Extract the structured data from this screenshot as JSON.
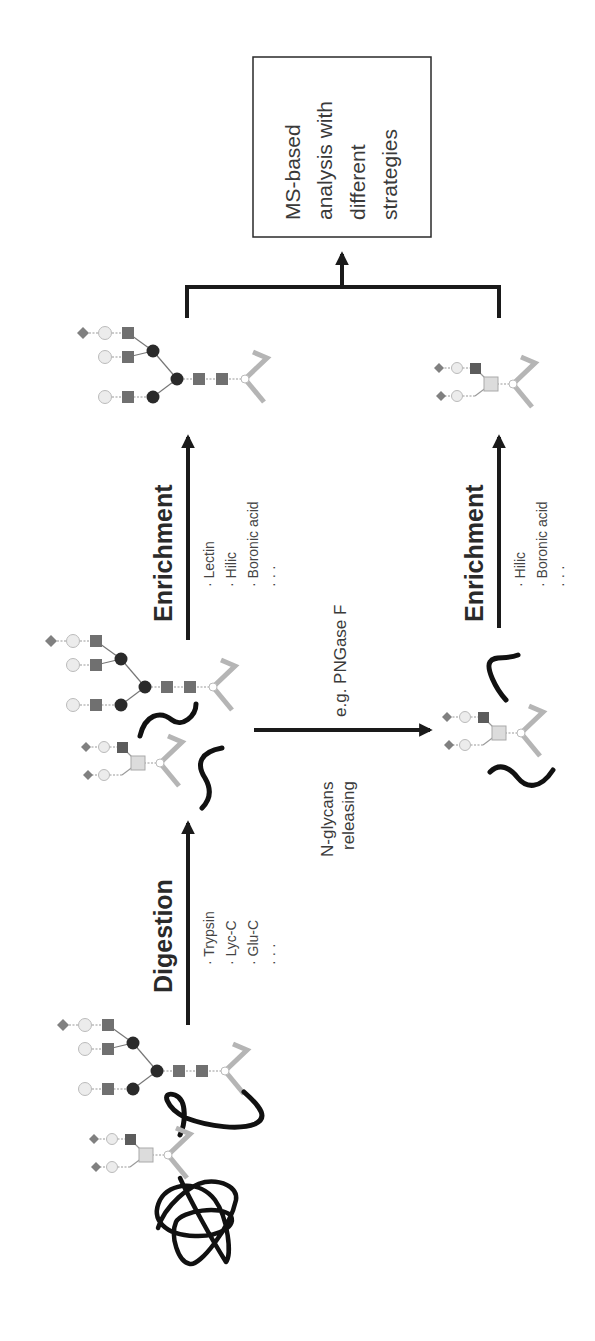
{
  "figure": {
    "orientation": "rotated-90-ccw",
    "colors": {
      "arrow": "#1a1a1a",
      "peptide_chain": "#111111",
      "asparagine_linker": "#b0b0b0",
      "glcnac_square": "#707070",
      "mannose_circle": "#2a2a2a",
      "galactose_circle": "#e8e8e8",
      "sialic_diamond": "#808080",
      "fucose_square_light": "#d8d8d8"
    }
  },
  "steps": {
    "digestion": {
      "label": "Digestion",
      "items": [
        "· Trypsin",
        "· Lyc-C",
        "· Glu-C",
        "· · ·"
      ]
    },
    "enrichment_top": {
      "label": "Enrichment",
      "items": [
        "· Lectin",
        "· Hilic",
        "· Boronic acid",
        "· · ·"
      ]
    },
    "release": {
      "label_line1": "N-glycans",
      "label_line2": "releasing",
      "example": "e.g. PNGase F"
    },
    "enrichment_bottom": {
      "label": "Enrichment",
      "items": [
        "· Hilic",
        "· Boronic acid",
        "· · ·"
      ]
    }
  },
  "output_box": {
    "lines": [
      "MS-based",
      "analysis with",
      "different",
      "strategies"
    ]
  }
}
